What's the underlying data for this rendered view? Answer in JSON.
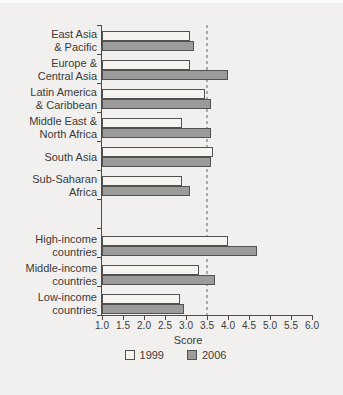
{
  "chart_data": {
    "type": "bar",
    "orientation": "horizontal",
    "title": "",
    "xlabel": "Score",
    "xlim": [
      1.0,
      6.0
    ],
    "xtick_labels": [
      "1.0",
      "1.5",
      "2.0",
      "2.5",
      "3.0",
      "3.5",
      "4.0",
      "4.5",
      "5.0",
      "5.5",
      "6.0"
    ],
    "reference_line_x": 3.5,
    "grid": false,
    "legend_position": "bottom",
    "group_break_after_index": 5,
    "categories": [
      "East Asia & Pacific",
      "Europe & Central Asia",
      "Latin America & Caribbean",
      "Middle East & North Africa",
      "South Asia",
      "Sub-Saharan Africa",
      "High-income countries",
      "Middle-income countries",
      "Low-income countries"
    ],
    "category_label_lines": [
      [
        "East Asia",
        "& Pacific"
      ],
      [
        "Europe &",
        "Central Asia"
      ],
      [
        "Latin America",
        "& Caribbean"
      ],
      [
        "Middle East &",
        "North Africa"
      ],
      [
        "South Asia"
      ],
      [
        "Sub-Saharan",
        "Africa"
      ],
      [
        "High-income",
        "countries"
      ],
      [
        "Middle-income",
        "countries"
      ],
      [
        "Low-income",
        "countries"
      ]
    ],
    "series": [
      {
        "name": "1999",
        "values": [
          3.1,
          3.1,
          3.45,
          2.9,
          3.65,
          2.9,
          4.0,
          3.3,
          2.85
        ]
      },
      {
        "name": "2006",
        "values": [
          3.2,
          4.0,
          3.6,
          3.6,
          3.6,
          3.1,
          4.7,
          3.7,
          2.95
        ]
      }
    ]
  },
  "colors": {
    "background": "#f1f0ee",
    "top_strip": "#fafaf8",
    "bar_1999_fill": "#f5f4f0",
    "bar_2006_fill": "#9b9c9a",
    "bar_border": "#525252",
    "reference_line": "#a9aba5",
    "axis_line": "#4b4b49",
    "text": "#3b3b38"
  }
}
